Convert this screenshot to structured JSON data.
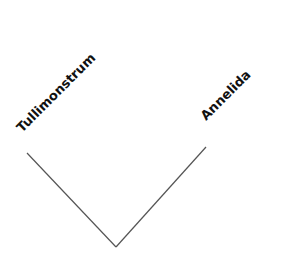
{
  "diagram": {
    "type": "cladogram",
    "taxa": [
      {
        "name": "Tullimonstrum",
        "tip": [
          27,
          153
        ]
      },
      {
        "name": "Annelida",
        "tip": [
          206,
          147
        ]
      }
    ],
    "root": [
      116,
      247
    ],
    "line_color": "#555555",
    "text_color": "#111111"
  }
}
